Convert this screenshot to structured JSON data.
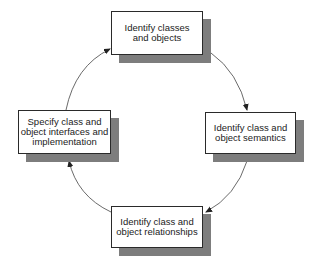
{
  "diagram": {
    "type": "cycle",
    "direction": "clockwise",
    "colors": {
      "box_fill": "#ffffff",
      "box_border": "#2a2a2a",
      "shadow": "#7d7d7d",
      "arrow": "#333333"
    },
    "nodes": [
      {
        "id": "top",
        "label": "Identify classes\nand objects"
      },
      {
        "id": "right",
        "label": "Identify class and\nobject semantics"
      },
      {
        "id": "bottom",
        "label": "Identify class and\nobject relationships"
      },
      {
        "id": "left",
        "label": "Specify class and\nobject interfaces and\nimplementation"
      }
    ],
    "edges": [
      {
        "from": "top",
        "to": "right"
      },
      {
        "from": "right",
        "to": "bottom"
      },
      {
        "from": "bottom",
        "to": "left"
      },
      {
        "from": "left",
        "to": "top"
      }
    ]
  }
}
